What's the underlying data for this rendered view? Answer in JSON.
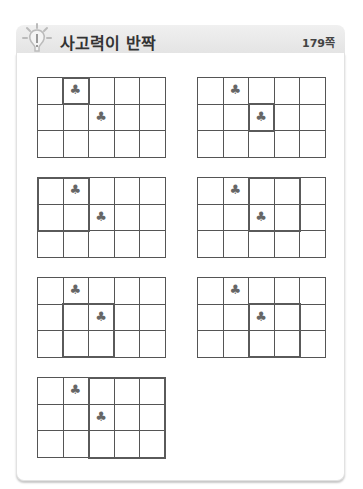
{
  "header": {
    "title": "사고력이 반짝",
    "page_ref": "179쪽",
    "icon": "lightbulb-icon"
  },
  "grid_spec": {
    "cols": 5,
    "rows": 3,
    "symbol": "♣"
  },
  "puzzles": [
    {
      "clubs": [
        [
          1,
          0
        ],
        [
          2,
          1
        ]
      ],
      "highlight": {
        "col": 1,
        "row": 0,
        "w": 1,
        "h": 1
      }
    },
    {
      "clubs": [
        [
          1,
          0
        ],
        [
          2,
          1
        ]
      ],
      "highlight": {
        "col": 2,
        "row": 1,
        "w": 1,
        "h": 1
      }
    },
    {
      "clubs": [
        [
          1,
          0
        ],
        [
          2,
          1
        ]
      ],
      "highlight": {
        "col": 0,
        "row": 0,
        "w": 2,
        "h": 2
      }
    },
    {
      "clubs": [
        [
          1,
          0
        ],
        [
          2,
          1
        ]
      ],
      "highlight": {
        "col": 2,
        "row": 0,
        "w": 2,
        "h": 2
      }
    },
    {
      "clubs": [
        [
          1,
          0
        ],
        [
          2,
          1
        ]
      ],
      "highlight": {
        "col": 1,
        "row": 1,
        "w": 2,
        "h": 2
      }
    },
    {
      "clubs": [
        [
          1,
          0
        ],
        [
          2,
          1
        ]
      ],
      "highlight": {
        "col": 2,
        "row": 1,
        "w": 2,
        "h": 2
      }
    },
    {
      "clubs": [
        [
          1,
          0
        ],
        [
          2,
          1
        ]
      ],
      "highlight": {
        "col": 2,
        "row": 0,
        "w": 3,
        "h": 3
      }
    }
  ]
}
